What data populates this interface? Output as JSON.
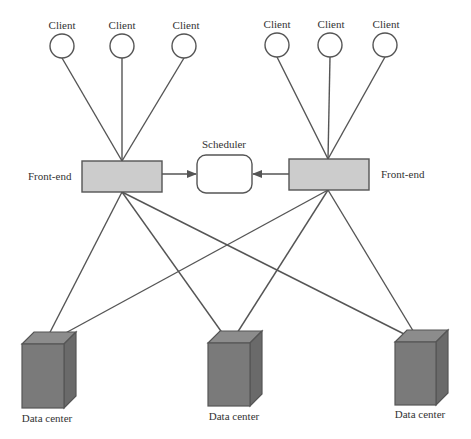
{
  "diagram": {
    "type": "distributed-architecture",
    "colors": {
      "line": "#555555",
      "frontend_fill": "#cccccc",
      "datacenter_front": "#7a7a7a",
      "datacenter_top": "#8c8c8c",
      "datacenter_side": "#6a6a6a",
      "background": "#ffffff"
    },
    "clients": [
      {
        "label": "Client",
        "group": "left"
      },
      {
        "label": "Client",
        "group": "left"
      },
      {
        "label": "Client",
        "group": "left"
      },
      {
        "label": "Client",
        "group": "right"
      },
      {
        "label": "Client",
        "group": "right"
      },
      {
        "label": "Client",
        "group": "right"
      }
    ],
    "frontends": [
      {
        "label": "Front-end",
        "side": "left"
      },
      {
        "label": "Front-end",
        "side": "right"
      }
    ],
    "scheduler": {
      "label": "Scheduler"
    },
    "datacenters": [
      {
        "label": "Data center"
      },
      {
        "label": "Data center"
      },
      {
        "label": "Data center"
      }
    ],
    "edges": [
      {
        "from": "client-1",
        "to": "frontend-left"
      },
      {
        "from": "client-2",
        "to": "frontend-left"
      },
      {
        "from": "client-3",
        "to": "frontend-left"
      },
      {
        "from": "client-4",
        "to": "frontend-right"
      },
      {
        "from": "client-5",
        "to": "frontend-right"
      },
      {
        "from": "client-6",
        "to": "frontend-right"
      },
      {
        "from": "frontend-left",
        "to": "scheduler",
        "arrow": true
      },
      {
        "from": "frontend-right",
        "to": "scheduler",
        "arrow": true
      },
      {
        "from": "frontend-left",
        "to": "datacenter-1"
      },
      {
        "from": "frontend-left",
        "to": "datacenter-2"
      },
      {
        "from": "frontend-left",
        "to": "datacenter-3"
      },
      {
        "from": "frontend-right",
        "to": "datacenter-1"
      },
      {
        "from": "frontend-right",
        "to": "datacenter-2"
      },
      {
        "from": "frontend-right",
        "to": "datacenter-3"
      }
    ]
  }
}
